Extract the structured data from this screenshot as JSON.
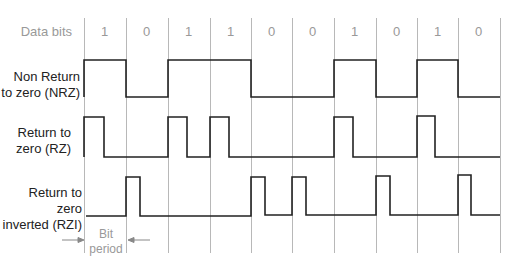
{
  "row_labels": {
    "data_bits": "Data bits",
    "nrz_line1": "Non Return",
    "nrz_line2": "to zero (NRZ)",
    "rz_line1": "Return to",
    "rz_line2": "zero (RZ)",
    "rzi_line1": "Return to zero",
    "rzi_line2": "inverted (RZI)"
  },
  "bit_period": {
    "line1": "Bit",
    "line2": "period"
  },
  "bits": [
    "1",
    "0",
    "1",
    "1",
    "0",
    "0",
    "1",
    "0",
    "1",
    "0"
  ],
  "grid_x": [
    84,
    126,
    168,
    210,
    251,
    292,
    334,
    376,
    417,
    458,
    500
  ],
  "colors": {
    "grid": "#b0b0b0",
    "wave": "#222222",
    "muted": "#999999"
  }
}
